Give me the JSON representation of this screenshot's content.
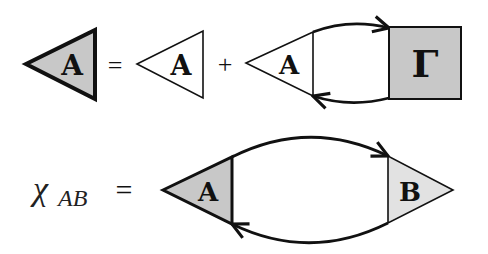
{
  "diagram": {
    "colors": {
      "stroke": "#111111",
      "fill_dark": "#c8c8c8",
      "fill_light": "#e2e2e2",
      "fill_white": "#ffffff"
    },
    "equation1": {
      "lhs_vertex_label": "A",
      "equals": "=",
      "term1_vertex_label": "A",
      "plus": "+",
      "term2_vertex_label": "A",
      "term2_box_label": "Γ"
    },
    "equation2": {
      "lhs_symbol": "χ",
      "lhs_subscript": "AB",
      "equals": "=",
      "left_vertex_label": "A",
      "right_vertex_label": "B"
    }
  }
}
